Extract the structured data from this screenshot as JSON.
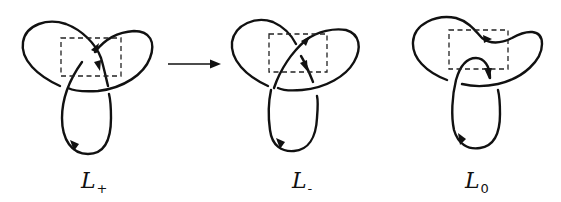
{
  "figure": {
    "transition_arrow": "right-arrow",
    "panels": [
      {
        "id": "L_plus",
        "label_main": "L",
        "label_sub": "+",
        "crossing": "positive crossing"
      },
      {
        "id": "L_minus",
        "label_main": "L",
        "label_sub": "-",
        "crossing": "negative crossing"
      },
      {
        "id": "L_zero",
        "label_main": "L",
        "label_sub": "0",
        "crossing": "smoothed (no crossing)"
      }
    ]
  },
  "colors": {
    "ink": "#111111",
    "background": "#ffffff"
  }
}
